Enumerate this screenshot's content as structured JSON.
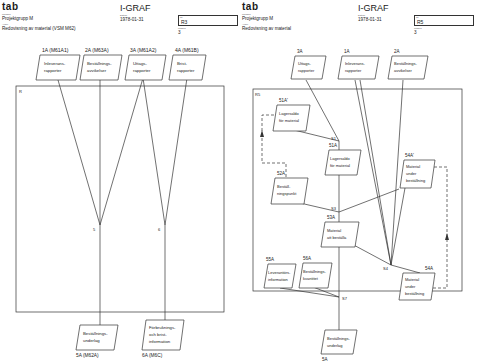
{
  "left": {
    "header": {
      "logo": "tab",
      "org_label": "Lärobok",
      "org": "Projektgrupp M",
      "subject_label": "Avser",
      "subject": "Redovisning av material (VSM M62)",
      "title": "I-GRAF",
      "date_label": "Datum",
      "date": "1978-01-31",
      "id_label": "Nr",
      "id": "R3",
      "page_label": "Utgåva",
      "page": "3"
    },
    "boundary_label": "R",
    "inputs": [
      {
        "code": "1A  (M61A1)",
        "lines": [
          "Inleverans-",
          "rapporter"
        ]
      },
      {
        "code": "2A  (M63A)",
        "lines": [
          "Beställnings-",
          "avvikelser"
        ]
      },
      {
        "code": "3A  (M61A2)",
        "lines": [
          "Uttags-",
          "rapporter"
        ]
      },
      {
        "code": "4A  (M61B)",
        "lines": [
          "Brist-",
          "rapporter"
        ]
      }
    ],
    "nodes": [
      "5",
      "6"
    ],
    "outputs": [
      {
        "code": "5A  (M62A)",
        "lines": [
          "Beställnings-",
          "underlag"
        ]
      },
      {
        "code": "6A  (M6C)",
        "lines": [
          "Förbruknings-",
          "och brist-",
          "information"
        ]
      }
    ]
  },
  "right": {
    "header": {
      "logo": "tab",
      "org_label": "Lärobok",
      "org": "Projektgrupp M",
      "subject_label": "Avser",
      "subject": "Redovisning av material",
      "title": "I-GRAF",
      "date_label": "Datum",
      "date": "1978-01-31",
      "id_label": "Nr",
      "id": "R5",
      "page_label": "Utgåva",
      "page": "3"
    },
    "boundary_label": "R5",
    "inputs": [
      {
        "code": "3A",
        "lines": [
          "Uttags-",
          "rapporter"
        ]
      },
      {
        "code": "1A",
        "lines": [
          "Inleverans-",
          "rapporter"
        ]
      },
      {
        "code": "2A",
        "lines": [
          "Beställnings-",
          "avvikelser"
        ]
      }
    ],
    "stores": [
      {
        "code": "51A'",
        "lines": [
          "Lagersaldo",
          "för material"
        ]
      },
      {
        "code": "51A",
        "lines": [
          "Lagersaldo",
          "för material"
        ]
      },
      {
        "code": "52A",
        "lines": [
          "Beställ-",
          "ningspunkt"
        ]
      },
      {
        "code": "53A",
        "lines": [
          "Material",
          "att beställa"
        ]
      },
      {
        "code": "54A'",
        "lines": [
          "Material",
          "under",
          "beställning"
        ]
      },
      {
        "code": "54A",
        "lines": [
          "Material",
          "under",
          "beställning"
        ]
      },
      {
        "code": "55A",
        "lines": [
          "Leverantörs-",
          "information"
        ]
      },
      {
        "code": "56A",
        "lines": [
          "Beställnings-",
          "kvantitet"
        ]
      }
    ],
    "nodes": [
      "S1",
      "S3",
      "S4",
      "S7"
    ],
    "outputs": [
      {
        "code": "5A",
        "lines": [
          "Beställnings-",
          "underlag"
        ]
      }
    ]
  }
}
